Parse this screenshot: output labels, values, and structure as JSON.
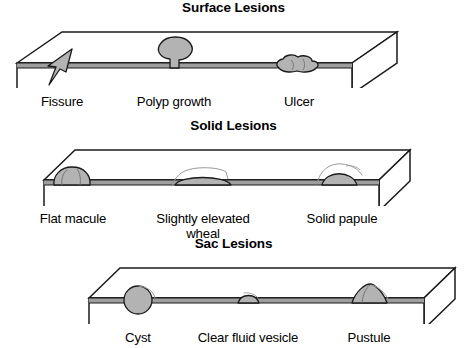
{
  "figure": {
    "background_color": "#ffffff",
    "ink_color": "#1a1a1a",
    "lesion_fill": "#b3b3b3",
    "skin_band_fill": "#9e9e9e",
    "top_face_fill": "#ffffff",
    "front_face_fill": "#ffffff"
  },
  "panels": [
    {
      "id": "surface-lesions",
      "title": "Surface Lesions",
      "labels": [
        {
          "text": "Fissure",
          "center_x": 62
        },
        {
          "text": "Polyp growth",
          "center_x": 174
        },
        {
          "text": "Ulcer",
          "center_x": 299
        }
      ],
      "lesions": [
        {
          "name": "fissure",
          "type": "cleft-wedge",
          "center_x": 62
        },
        {
          "name": "polyp-growth",
          "type": "stalked-mushroom",
          "center_x": 174
        },
        {
          "name": "ulcer",
          "type": "irregular-crater",
          "center_x": 299
        }
      ]
    },
    {
      "id": "solid-lesions",
      "title": "Solid Lesions",
      "labels": [
        {
          "text": "Flat macule",
          "center_x": 73
        },
        {
          "text": "Slightly elevated\nwheal",
          "center_x": 203
        },
        {
          "text": "Solid papule",
          "center_x": 342
        }
      ],
      "lesions": [
        {
          "name": "flat-macule",
          "type": "low-dome",
          "center_x": 73
        },
        {
          "name": "slightly-elevated-wheal",
          "type": "flat-broad-bump",
          "center_x": 203
        },
        {
          "name": "solid-papule",
          "type": "rounded-bump",
          "center_x": 342
        }
      ]
    },
    {
      "id": "sac-lesions",
      "title": "Sac Lesions",
      "labels": [
        {
          "text": "Cyst",
          "center_x": 138
        },
        {
          "text": "Clear fluid vesicle",
          "center_x": 248
        },
        {
          "text": "Pustule",
          "center_x": 369
        }
      ],
      "lesions": [
        {
          "name": "cyst",
          "type": "sphere-straddling-skin",
          "center_x": 138
        },
        {
          "name": "clear-fluid-vesicle",
          "type": "small-low-bump",
          "center_x": 248
        },
        {
          "name": "pustule",
          "type": "peaked-dome",
          "center_x": 369
        }
      ]
    }
  ]
}
